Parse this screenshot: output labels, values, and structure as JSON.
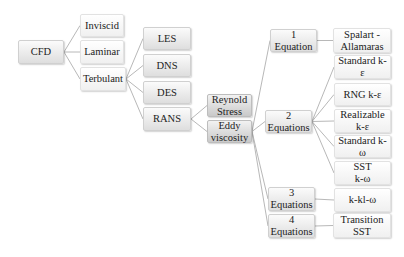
{
  "diagram": {
    "type": "tree",
    "root": "CFD",
    "nodes": {
      "cfd": "CFD",
      "inviscid": "Inviscid",
      "laminar": "Laminar",
      "terbulant": "Terbulant",
      "les": "LES",
      "dns": "DNS",
      "des": "DES",
      "rans": "RANS",
      "reynold_stress": "Reynold\nStress",
      "eddy_viscosity": "Eddy\nviscosity",
      "eq1": "1 Equation",
      "eq2": "2 Equations",
      "eq3": "3 Equations",
      "eq4": "4 Equations",
      "spalart": "Spalart -\nAllamaras",
      "std_ke": "Standard k-ε",
      "rng_ke": "RNG k-ε",
      "real_ke": "Realizable\nk-ε",
      "std_kw": "Standard k-ω",
      "sst_kw": "SST\nk-ω",
      "kklw": "k-kl-ω",
      "trans_sst": "Transition\nSST"
    },
    "edges": [
      [
        "cfd",
        "inviscid"
      ],
      [
        "cfd",
        "laminar"
      ],
      [
        "cfd",
        "terbulant"
      ],
      [
        "terbulant",
        "les"
      ],
      [
        "terbulant",
        "dns"
      ],
      [
        "terbulant",
        "des"
      ],
      [
        "terbulant",
        "rans"
      ],
      [
        "rans",
        "reynold_stress"
      ],
      [
        "rans",
        "eddy_viscosity"
      ],
      [
        "eddy_viscosity",
        "eq1"
      ],
      [
        "eddy_viscosity",
        "eq2"
      ],
      [
        "eddy_viscosity",
        "eq3"
      ],
      [
        "eddy_viscosity",
        "eq4"
      ],
      [
        "eq1",
        "spalart"
      ],
      [
        "eq2",
        "std_ke"
      ],
      [
        "eq2",
        "rng_ke"
      ],
      [
        "eq2",
        "real_ke"
      ],
      [
        "eq2",
        "std_kw"
      ],
      [
        "eq2",
        "sst_kw"
      ],
      [
        "eq3",
        "kklw"
      ],
      [
        "eq4",
        "trans_sst"
      ]
    ],
    "colors": {
      "line": "#b8b8b8",
      "text": "#222222"
    }
  }
}
